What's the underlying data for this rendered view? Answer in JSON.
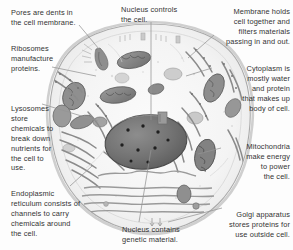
{
  "diagram": {
    "style": "grayscale pencil illustration",
    "background_color": "#fdfdfd",
    "text_color": "#333333",
    "leader_line_color": "#8a8a8a"
  },
  "labels": {
    "pores": {
      "text": "Pores are dents in\nthe cell membrane.",
      "align": "left"
    },
    "ribosomes": {
      "text": "Ribosomes\nmanufacture\nproteins.",
      "align": "left"
    },
    "lysosomes": {
      "text": "Lysosomes\nstore\nchemicals to\nbreak down\nnutrients for\nthe cell to\nuse.",
      "align": "left"
    },
    "endoplasmic_reticulum": {
      "text": "Endoplasmic\nreticulum consists of\nchannels to carry\nchemicals around\nthe cell.",
      "align": "left"
    },
    "nucleus_controls": {
      "text": "Nucleus controls\nthe cell.",
      "align": "left"
    },
    "nucleus_genetic": {
      "text": "Nucleus contains\ngenetic material.",
      "align": "left"
    },
    "membrane": {
      "text": "Membrane holds\ncell together and\nfilters materials\npassing in and out.",
      "align": "right"
    },
    "cytoplasm": {
      "text": "Cytoplasm is\nmostly water\nand protein\nthat makes up\nbody of cell.",
      "align": "right"
    },
    "mitochondria": {
      "text": "Mitochondria\nmake energy\nto power\nthe cell.",
      "align": "right"
    },
    "golgi": {
      "text": "Golgi apparatus\nstores proteins for\nuse outside cell.",
      "align": "right"
    }
  },
  "organelles": {
    "cell_membrane": "outer-boundary",
    "nucleus": "large dark speckled oval",
    "nucleolus_dots_count": 7,
    "mitochondria_count": 8,
    "lysosome_count": 3,
    "golgi_stacks": 4
  }
}
